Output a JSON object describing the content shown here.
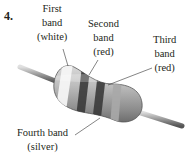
{
  "problem_number": "4.",
  "labels": {
    "first": {
      "line1": "First",
      "line2": "band",
      "line3": "(white)"
    },
    "second": {
      "line1": "Second",
      "line2": "band",
      "line3": "(red)"
    },
    "third": {
      "line1": "Third",
      "line2": "band",
      "line3": "(red)"
    },
    "fourth": {
      "line1": "Fourth band",
      "line2": "(silver)"
    }
  },
  "bands": [
    {
      "name": "first",
      "color": "white"
    },
    {
      "name": "second",
      "color": "red"
    },
    {
      "name": "third",
      "color": "red"
    },
    {
      "name": "fourth",
      "color": "silver"
    }
  ]
}
